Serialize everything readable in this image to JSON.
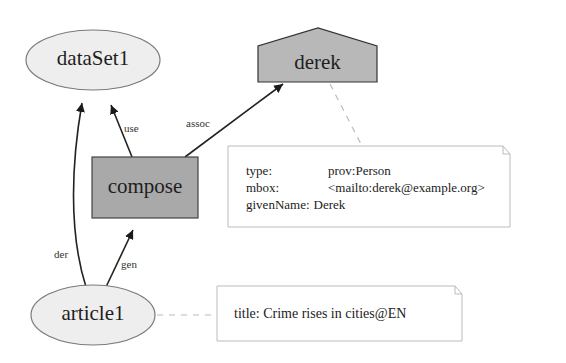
{
  "nodes": {
    "dataset": {
      "label": "dataSet1",
      "shape": "ellipse"
    },
    "agent": {
      "label": "derek",
      "shape": "house"
    },
    "activity": {
      "label": "compose",
      "shape": "rectangle"
    },
    "article": {
      "label": "article1",
      "shape": "ellipse"
    }
  },
  "edges": {
    "use": "use",
    "assoc": "assoc",
    "der": "der",
    "gen": "gen"
  },
  "notes": {
    "person": {
      "rows": [
        {
          "key": "type:",
          "value": "prov:Person"
        },
        {
          "key": "mbox:",
          "value": "<mailto:derek@example.org>"
        },
        {
          "key": "givenName:",
          "value": "Derek"
        }
      ]
    },
    "article": {
      "key": "title:",
      "value": "Crime rises in cities@EN"
    }
  },
  "colors": {
    "entity_fill": "#eeeeee",
    "agent_fill": "#b8b8b8",
    "activity_fill": "#a9a9a9",
    "stroke": "#333333",
    "note_stroke": "#bbbbbb"
  }
}
